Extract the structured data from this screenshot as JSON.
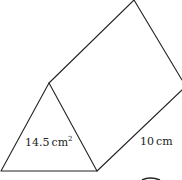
{
  "diagram": {
    "type": "triangular-prism",
    "labels": {
      "area": "14.5",
      "area_unit": "cm",
      "area_exp": "2",
      "length": "10",
      "length_unit": "cm"
    },
    "colors": {
      "stroke": "#222222",
      "background": "#ffffff"
    }
  }
}
